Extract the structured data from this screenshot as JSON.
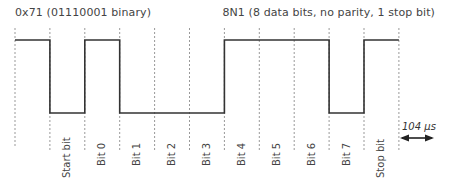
{
  "header": {
    "value_label": "0x71 (01110001 binary)",
    "format_label": "8N1 (8 data bits, no parity, 1 stop bit)"
  },
  "timing": {
    "bit_duration_label": "104 µs"
  },
  "bits": [
    {
      "label": "Start bit",
      "level": 0
    },
    {
      "label": "Bit 0",
      "level": 1
    },
    {
      "label": "Bit 1",
      "level": 0
    },
    {
      "label": "Bit 2",
      "level": 0
    },
    {
      "label": "Bit 3",
      "level": 0
    },
    {
      "label": "Bit 4",
      "level": 1
    },
    {
      "label": "Bit 5",
      "level": 1
    },
    {
      "label": "Bit 6",
      "level": 1
    },
    {
      "label": "Bit 7",
      "level": 0
    },
    {
      "label": "Stop bit",
      "level": 1
    }
  ],
  "idle_level": 1,
  "colors": {
    "waveform": "#333333",
    "gridline": "#999999"
  }
}
